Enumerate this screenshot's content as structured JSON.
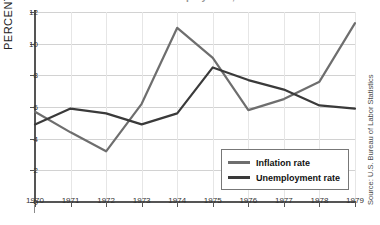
{
  "title_clipped": "Inflation and Unemployment, 1970-1979",
  "source_note": "Source: U.S. Bureau of Labor Statistics",
  "axis": {
    "ylabel": "PERCENT",
    "yticks": [
      "0",
      "2",
      "4",
      "6",
      "8",
      "10",
      "12"
    ],
    "xticks": [
      "1970",
      "1971",
      "1972",
      "1973",
      "1974",
      "1975",
      "1976",
      "1977",
      "1978",
      "1979"
    ]
  },
  "legend": {
    "items": [
      {
        "label": "Inflation rate",
        "color": "#6e6e6e"
      },
      {
        "label": "Unemployment rate",
        "color": "#3a3a3a"
      }
    ]
  },
  "chart_data": {
    "type": "line",
    "title": "Inflation and Unemployment, 1970-1979",
    "xlabel": "",
    "ylabel": "PERCENT",
    "x": [
      1970,
      1971,
      1972,
      1973,
      1974,
      1975,
      1976,
      1977,
      1978,
      1979
    ],
    "xlim": [
      1970,
      1979
    ],
    "ylim": [
      0,
      12
    ],
    "ytick_step": 2,
    "grid": "horizontal-and-vertical",
    "legend_position": "lower-right",
    "series": [
      {
        "name": "Inflation rate",
        "color": "#6e6e6e",
        "values": [
          5.7,
          4.4,
          3.2,
          6.2,
          11.0,
          9.1,
          5.8,
          6.5,
          7.6,
          11.3
        ]
      },
      {
        "name": "Unemployment rate",
        "color": "#3a3a3a",
        "values": [
          4.9,
          5.9,
          5.6,
          4.9,
          5.6,
          8.5,
          7.7,
          7.1,
          6.1,
          5.9
        ]
      }
    ]
  }
}
